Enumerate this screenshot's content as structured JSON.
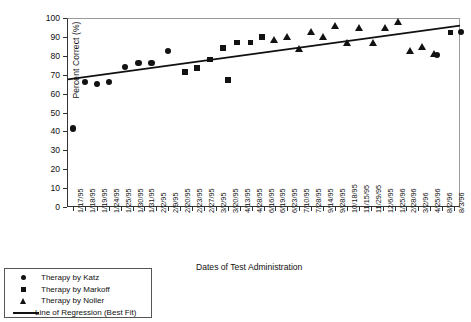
{
  "chart_data": {
    "type": "scatter",
    "title": "",
    "xlabel": "Dates of Test Administration",
    "ylabel": "Percent Correct (%)",
    "ylim": [
      0,
      100
    ],
    "ytick_step": 10,
    "yticks": [
      0,
      10,
      20,
      30,
      40,
      50,
      60,
      70,
      80,
      90,
      100
    ],
    "grid": false,
    "legend_position": "below-left",
    "categories": [
      "1/17/95",
      "1/18/95",
      "1/19/95",
      "1/24/95",
      "1/25/95",
      "1/30/95",
      "1/31/95",
      "2/2/95",
      "2/9/95",
      "2/20/95",
      "2/23/95",
      "2/27/95",
      "3/2/95",
      "3/20/95",
      "4/13/95",
      "4/28/95",
      "6/16/95",
      "6/19/95",
      "6/23/95",
      "7/10/95",
      "7/28/95",
      "9/14/95",
      "9/28/95",
      "10/18/95",
      "11/15/95",
      "11/29/95",
      "12/6/95",
      "1/25/96",
      "2/28/96",
      "3/2/96",
      "4/25/96",
      "8/2/96",
      "8/3/96"
    ],
    "series": [
      {
        "name": "Therapy by Katz",
        "marker": "circle",
        "color": "#121212",
        "points": [
          {
            "x": "1/17/95",
            "xi": 0,
            "y": 41.5
          },
          {
            "x": "1/18/95",
            "xi": 1,
            "y": 66
          },
          {
            "x": "1/19/95",
            "xi": 2,
            "y": 65
          },
          {
            "x": "1/24/95",
            "xi": 3,
            "y": 66
          },
          {
            "x": "1/25/95",
            "xi": 4.4,
            "y": 74
          },
          {
            "x": "1/30/95",
            "xi": 5.5,
            "y": 76
          },
          {
            "x": "1/31/95",
            "xi": 6.6,
            "y": 76
          },
          {
            "x": "2/2/95",
            "xi": 8,
            "y": 82.5
          },
          {
            "x": "4/25/96",
            "xi": 30.6,
            "y": 80.3
          },
          {
            "x": "8/3/96",
            "xi": 32.6,
            "y": 92.5
          }
        ]
      },
      {
        "name": "Therapy by Markoff",
        "marker": "square",
        "color": "#121212",
        "points": [
          {
            "x": "2/20/95",
            "xi": 9.4,
            "y": 71.5
          },
          {
            "x": "2/23/95",
            "xi": 10.4,
            "y": 73.5
          },
          {
            "x": "2/27/95",
            "xi": 11.5,
            "y": 78
          },
          {
            "x": "3/2/95",
            "xi": 12.6,
            "y": 84
          },
          {
            "x": "3/20/95",
            "xi": 13.8,
            "y": 87
          },
          {
            "x": "4/13/95",
            "xi": 14.9,
            "y": 87
          },
          {
            "x": "4/28/95",
            "xi": 15.9,
            "y": 90
          },
          {
            "x": "6/16/95",
            "xi": 13.0,
            "y": 67
          },
          {
            "x": "8/2/96",
            "xi": 31.7,
            "y": 92.3
          }
        ]
      },
      {
        "name": "Therapy by Noller",
        "marker": "triangle",
        "color": "#121212",
        "points": [
          {
            "x": "6/16/95",
            "xi": 16.9,
            "y": 88.5
          },
          {
            "x": "6/19/95",
            "xi": 18.0,
            "y": 90
          },
          {
            "x": "6/23/95",
            "xi": 19.0,
            "y": 84
          },
          {
            "x": "7/10/95",
            "xi": 20.0,
            "y": 93
          },
          {
            "x": "7/28/95",
            "xi": 21.0,
            "y": 90
          },
          {
            "x": "9/14/95",
            "xi": 22.0,
            "y": 96
          },
          {
            "x": "9/28/95",
            "xi": 23.0,
            "y": 87
          },
          {
            "x": "10/18/95",
            "xi": 24.0,
            "y": 95
          },
          {
            "x": "11/15/95",
            "xi": 25.2,
            "y": 87
          },
          {
            "x": "11/29/95",
            "xi": 26.2,
            "y": 95
          },
          {
            "x": "12/6/95",
            "xi": 27.3,
            "y": 98
          },
          {
            "x": "1/25/96",
            "xi": 28.3,
            "y": 83
          },
          {
            "x": "2/28/96",
            "xi": 29.3,
            "y": 85
          },
          {
            "x": "3/2/96",
            "xi": 30.3,
            "y": 81
          }
        ]
      }
    ],
    "regression": {
      "name": "Line of Regression (Best Fit)",
      "color": "#111111",
      "y_start": 67.5,
      "y_end": 96.0
    }
  },
  "legend": {
    "items": [
      {
        "label": "Therapy by Katz",
        "symbol": "circle-marker"
      },
      {
        "label": "Therapy by Markoff",
        "symbol": "square-marker"
      },
      {
        "label": "Therapy by Noller",
        "symbol": "triangle-marker"
      },
      {
        "label": "Line of Regression (Best Fit)",
        "symbol": "line-swatch"
      }
    ]
  }
}
